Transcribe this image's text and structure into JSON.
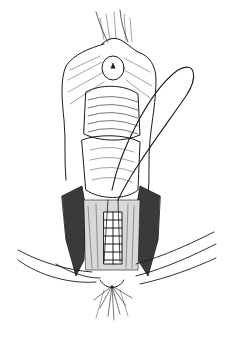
{
  "image": {
    "kind": "surgical line illustration",
    "width": 226,
    "height": 343,
    "background": "#ffffff",
    "ink": "#1a1a1a"
  },
  "figure": {
    "regions": [
      "upper-tissue-fold",
      "retracted-flaps",
      "central-mucosa",
      "lower-wound-cavity",
      "suture-row",
      "loop-suture",
      "lateral-sutures",
      "perineal-tissue"
    ]
  }
}
